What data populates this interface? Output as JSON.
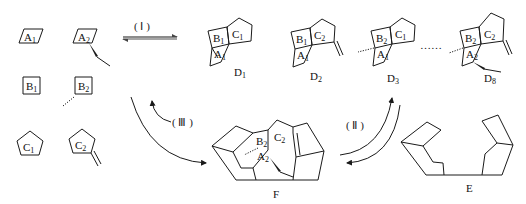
{
  "fragments": {
    "A1": {
      "letter": "A",
      "sub": "1"
    },
    "A2": {
      "letter": "A",
      "sub": "2"
    },
    "B1": {
      "letter": "B",
      "sub": "1"
    },
    "B2": {
      "letter": "B",
      "sub": "2"
    },
    "C1": {
      "letter": "C",
      "sub": "1"
    },
    "C2": {
      "letter": "C",
      "sub": "2"
    }
  },
  "steps": {
    "I": "( Ⅰ )",
    "II": "( Ⅱ )",
    "III": "( Ⅲ )"
  },
  "products": {
    "D1": {
      "letter": "D",
      "sub": "1"
    },
    "D2": {
      "letter": "D",
      "sub": "2"
    },
    "D3": {
      "letter": "D",
      "sub": "3"
    },
    "D8": {
      "letter": "D",
      "sub": "8"
    },
    "F": "F",
    "E": "E"
  },
  "ellipsis": "……",
  "colors": {
    "line": "#1a1a1a",
    "arrow": "#555555",
    "background": "#ffffff"
  }
}
